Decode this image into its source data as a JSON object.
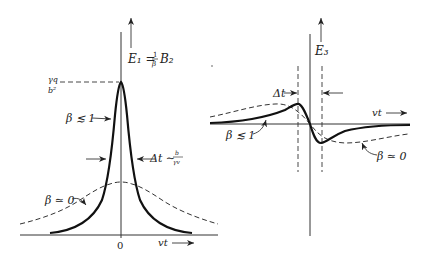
{
  "figure": {
    "left_panel": {
      "y_axis_label": "E₁ = ",
      "y_axis_label_frac_num": "1",
      "y_axis_label_frac_den": "β",
      "y_axis_label_tail": "B₂",
      "peak_label_num": "γq",
      "peak_label_den": "b²",
      "origin_label": "0",
      "x_axis_label": "vt",
      "curve_relativistic_label": "β ≲ 1",
      "curve_nonrelativistic_label": "β ≃ 0",
      "width_label": "Δt ∼ ",
      "width_label_frac_num": "b",
      "width_label_frac_den": "γv"
    },
    "right_panel": {
      "y_axis_label": "E₃",
      "x_axis_label": "vt",
      "width_label": "Δt",
      "curve_relativistic_label": "β ≲ 1",
      "curve_nonrelativistic_label": "β ≃ 0"
    },
    "colors": {
      "ink": "#111111",
      "background": "#ffffff"
    }
  }
}
